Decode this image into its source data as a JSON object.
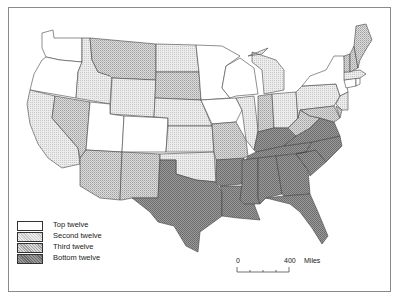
{
  "map": {
    "subject": "United States by state, ranked in four groups",
    "categories": [
      {
        "key": "top",
        "label": "Top twelve",
        "fill": "#ffffff"
      },
      {
        "key": "second",
        "label": "Second twelve",
        "fill": "#e0e0e0"
      },
      {
        "key": "third",
        "label": "Third twelve",
        "fill": "#c4c4c4"
      },
      {
        "key": "bottom",
        "label": "Bottom twelve",
        "fill": "#8c8c8c"
      }
    ],
    "states": {
      "WA": "top",
      "OR": "top",
      "UT": "top",
      "CO": "top",
      "MN": "top",
      "WI": "top",
      "IA": "top",
      "NY": "top",
      "CT": "top",
      "RI": "top",
      "CA": "second",
      "ID": "second",
      "WY": "second",
      "NE": "second",
      "KS": "second",
      "ND": "second",
      "OK": "second",
      "IL": "second",
      "MI": "second",
      "OH": "second",
      "PA": "second",
      "NJ": "second",
      "MA": "second",
      "MT": "third",
      "NV": "third",
      "AZ": "third",
      "NM": "third",
      "SD": "third",
      "MO": "third",
      "IN": "third",
      "WV": "third",
      "ME": "third",
      "VT": "third",
      "NH": "third",
      "DE": "third",
      "MD": "third",
      "TX": "bottom",
      "AR": "bottom",
      "LA": "bottom",
      "MS": "bottom",
      "AL": "bottom",
      "GA": "bottom",
      "FL": "bottom",
      "TN": "bottom",
      "KY": "bottom",
      "SC": "bottom",
      "NC": "bottom",
      "VA": "bottom"
    }
  },
  "legend": {
    "items": [
      {
        "label": "Top twelve"
      },
      {
        "label": "Second twelve"
      },
      {
        "label": "Third twelve"
      },
      {
        "label": "Bottom twelve"
      }
    ]
  },
  "scale_bar": {
    "start": "0",
    "end": "400",
    "unit": "Miles"
  }
}
